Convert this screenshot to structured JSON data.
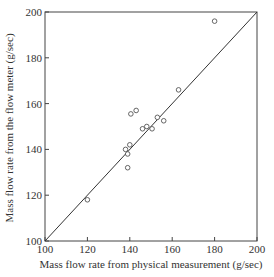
{
  "chart_data": {
    "type": "scatter",
    "title": "",
    "xlabel": "Mass flow rate from physical measurement (g/sec)",
    "ylabel": "Mass flow rate from the flow meter (g/sec)",
    "xlim": [
      100,
      200
    ],
    "ylim": [
      100,
      200
    ],
    "x_ticks": [
      100,
      120,
      140,
      160,
      180,
      200
    ],
    "y_ticks": [
      100,
      120,
      140,
      160,
      180,
      200
    ],
    "grid": false,
    "legend": null,
    "reference_line": {
      "label": "y = x",
      "from": [
        100,
        100
      ],
      "to": [
        200,
        200
      ]
    },
    "series": [
      {
        "name": "measurements",
        "marker": "open-circle",
        "points": [
          {
            "x": 120,
            "y": 118
          },
          {
            "x": 138,
            "y": 140
          },
          {
            "x": 139,
            "y": 138
          },
          {
            "x": 140,
            "y": 142
          },
          {
            "x": 139,
            "y": 132
          },
          {
            "x": 140.5,
            "y": 155.5
          },
          {
            "x": 143,
            "y": 157
          },
          {
            "x": 146,
            "y": 149
          },
          {
            "x": 148,
            "y": 150
          },
          {
            "x": 150.5,
            "y": 149
          },
          {
            "x": 153,
            "y": 154
          },
          {
            "x": 156,
            "y": 152.5
          },
          {
            "x": 163,
            "y": 166
          },
          {
            "x": 180,
            "y": 196
          }
        ]
      }
    ]
  }
}
